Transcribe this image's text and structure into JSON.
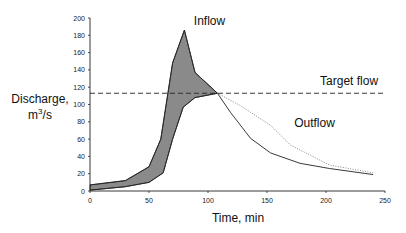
{
  "chart_data": {
    "type": "line",
    "title": "",
    "xlabel": "Time, min",
    "ylabel_line1": "Discharge,",
    "ylabel_line2_base": "m",
    "ylabel_line2_sup": "3",
    "ylabel_line2_tail": "/s",
    "xlim": [
      0,
      250
    ],
    "ylim": [
      0,
      200
    ],
    "xticks": [
      0,
      50,
      100,
      150,
      200,
      250
    ],
    "yticks": [
      0,
      20,
      40,
      60,
      80,
      100,
      120,
      140,
      160,
      180,
      200
    ],
    "grid": false,
    "series": [
      {
        "name": "Inflow",
        "style": "solid",
        "x": [
          0,
          30,
          50,
          60,
          70,
          80,
          89,
          108,
          119,
          136,
          153,
          178,
          203,
          240
        ],
        "values": [
          7,
          12,
          28,
          60,
          148,
          186,
          137,
          113,
          91,
          61,
          44,
          32,
          26,
          19
        ]
      },
      {
        "name": "Outflow (regulated)",
        "style": "solid",
        "x": [
          0,
          30,
          50,
          62,
          70,
          79,
          89,
          108
        ],
        "values": [
          1,
          5,
          10,
          21,
          60,
          97,
          108,
          113
        ]
      },
      {
        "name": "Outflow",
        "style": "dotted",
        "x": [
          108,
          127,
          153,
          170,
          203,
          240
        ],
        "values": [
          113,
          99,
          76,
          53,
          30,
          21
        ]
      }
    ],
    "shaded_region": {
      "between": [
        "Inflow",
        "Outflow (regulated)"
      ],
      "x_range": [
        0,
        108
      ],
      "fill": "#8a8a8a"
    },
    "reference_line": {
      "name": "Target flow",
      "y": 113,
      "style": "dashed"
    },
    "annotations": [
      {
        "text": "Inflow",
        "x": 88,
        "y": 192
      },
      {
        "text": "Target flow",
        "x": 195,
        "y": 122
      },
      {
        "text": "Outflow",
        "x": 173,
        "y": 74
      }
    ]
  },
  "colors": {
    "line": "#222222",
    "dotted": "#777777",
    "fill": "#8a8a8a"
  }
}
